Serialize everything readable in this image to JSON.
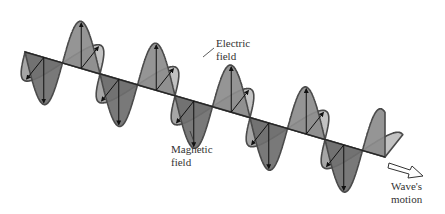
{
  "figure": {
    "labels": {
      "electric": [
        "Electric",
        "field"
      ],
      "magnetic": [
        "Magnetic",
        "field"
      ],
      "wave": [
        "Wave's",
        "motion"
      ]
    }
  },
  "colors": {
    "background": "#ffffff",
    "outline": "#4a4a4a",
    "electric_fill": "#8c8c8c",
    "electric_fill_dark": "#6e6e6e",
    "magnetic_fill_light": "#c2c2c2",
    "magnetic_fill": "#a6a6a6",
    "axis": "#222222",
    "label": "#333333"
  },
  "geometry": {
    "axis_start": [
      25,
      52
    ],
    "axis_end": [
      385,
      157
    ],
    "wavelength_px": 75,
    "periods": 4.8
  }
}
